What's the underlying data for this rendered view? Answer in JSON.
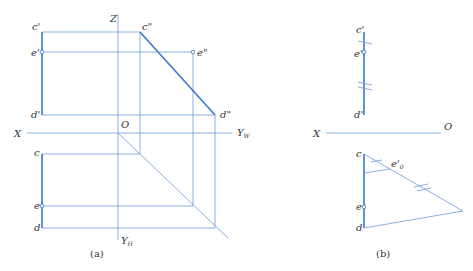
{
  "figure_a": {
    "caption": "(a)",
    "axes": {
      "z": "Z",
      "x": "X",
      "origin": "O",
      "yw": "Y",
      "yw_sub": "W",
      "yh": "Y",
      "yh_sub": "H"
    },
    "labels": {
      "c_prime": "c'",
      "e_prime": "e'",
      "d_prime": "d'",
      "c_dprime": "c\"",
      "e_dprime": "e\"",
      "d_dprime": "d\"",
      "c": "c",
      "e": "e",
      "d": "d"
    }
  },
  "figure_b": {
    "caption": "(b)",
    "axes": {
      "x": "X",
      "origin": "O"
    },
    "labels": {
      "c_prime": "c'",
      "e_prime": "e'",
      "d_prime": "d'",
      "c": "c",
      "e": "e",
      "d": "d",
      "e0_prime": "e'",
      "e0_sub": "0"
    }
  },
  "colors": {
    "line": "#7aa7dc",
    "line_strong": "#3a78cc",
    "text": "#333333"
  }
}
